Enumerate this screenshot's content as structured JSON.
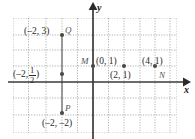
{
  "figure": {
    "type": "coordinate-plane",
    "axes": {
      "x_axis_label": "x",
      "y_axis_label": "y",
      "x_axis_y_pixel": 82,
      "y_axis_x_pixel": 93,
      "grid_spacing_px": 15.5,
      "grid_left_px": 13,
      "grid_right_px": 177,
      "grid_top_px": 18,
      "grid_bottom_px": 133,
      "x_range": [
        -5,
        5.5
      ],
      "y_range": [
        -3.5,
        4
      ]
    },
    "colors": {
      "axis": "#3a3a3a",
      "grid": "#9a9a9a",
      "point": "#4a4a4a",
      "text": "#2b2b2b",
      "point_label": "#555555"
    },
    "points": [
      {
        "name": "Q",
        "label": "(–2, 3)",
        "x": -2,
        "y": 3,
        "px": 62,
        "py": 35,
        "label_side": "left",
        "name_side": "right"
      },
      {
        "name": "",
        "label": "(–2, ½)",
        "x": -2,
        "y": 0.5,
        "px": 62,
        "py": 74,
        "label_side": "left",
        "name_side": "none",
        "is_fraction": true,
        "frac_num": "1",
        "frac_den": "2",
        "frac_prefix": "(–2,",
        "frac_suffix": ")"
      },
      {
        "name": "P",
        "label": "(–2, –2)",
        "x": -2,
        "y": -2,
        "px": 62,
        "py": 113,
        "label_side": "below",
        "name_side": "above"
      },
      {
        "name": "M",
        "label": "(0, 1)",
        "x": 0,
        "y": 1,
        "px": 93,
        "py": 66,
        "label_side": "right",
        "name_side": "left"
      },
      {
        "name": "",
        "label": "(2, 1)",
        "x": 2,
        "y": 1,
        "px": 124,
        "py": 66,
        "label_side": "below",
        "name_side": "none"
      },
      {
        "name": "N",
        "label": "(4, 1)",
        "x": 4,
        "y": 1,
        "px": 155,
        "py": 66,
        "label_side": "above",
        "name_side": "below-right"
      }
    ],
    "segments": [
      {
        "from": "Q",
        "to": "P",
        "orientation": "vertical",
        "x_px": 62
      }
    ]
  },
  "labels": {
    "q_coord": "(–2, 3)",
    "q_name": "Q",
    "half_prefix": "(–2,",
    "half_num": "1",
    "half_den": "2",
    "half_suffix": ")",
    "p_coord": "(–2, –2)",
    "p_name": "P",
    "m_name": "M",
    "m_coord": "(0, 1)",
    "two_one_coord": "(2, 1)",
    "n_coord": "(4, 1)",
    "n_name": "N",
    "x_axis": "x",
    "y_axis": "y"
  }
}
